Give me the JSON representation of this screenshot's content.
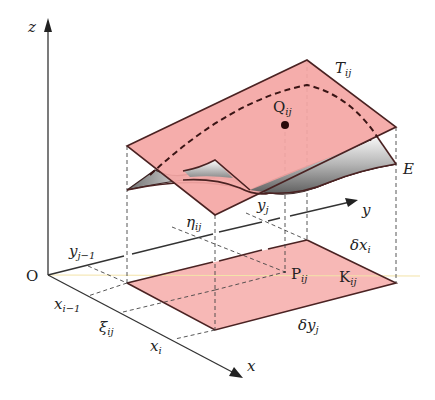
{
  "diagram": {
    "type": "3d-surface-integral-element",
    "colors": {
      "tangent_plane_fill": "#f4a7a5",
      "base_fill": "#f7b8b6",
      "surface_gray_light": "#f2f2f2",
      "surface_gray_dark": "#7a7a7a",
      "edge": "#4a2222",
      "axis": "#333333",
      "highlight_line": "#f3e3a8"
    },
    "axes": {
      "z": "z",
      "y": "y",
      "x": "x",
      "origin": "O"
    },
    "labels": {
      "tangent_plane": {
        "main": "T",
        "sub": "ij"
      },
      "point_q": {
        "main": "Q",
        "sub": "ij"
      },
      "surface": {
        "main": "E"
      },
      "eta": {
        "main": "η",
        "sub": "ij"
      },
      "y_j": {
        "main": "y",
        "sub": "j"
      },
      "y_j_minus_1": {
        "main": "y",
        "sub": "j−1"
      },
      "x_i_minus_1": {
        "main": "x",
        "sub": "i−1"
      },
      "xi": {
        "main": "ξ",
        "sub": "ij"
      },
      "x_i": {
        "main": "x",
        "sub": "i"
      },
      "delta_x": {
        "main": "δx",
        "sub": "i"
      },
      "delta_y": {
        "main": "δy",
        "sub": "j"
      },
      "point_p": {
        "main": "P",
        "sub": "ij"
      },
      "region_k": {
        "main": "K",
        "sub": "ij"
      }
    }
  }
}
